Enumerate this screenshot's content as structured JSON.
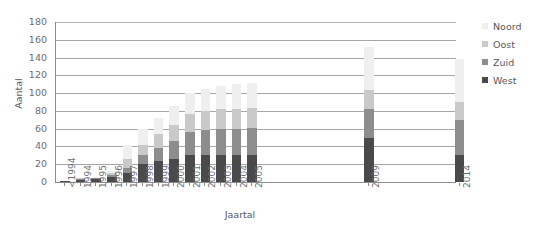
{
  "chart_data": {
    "type": "bar",
    "subtype": "stacked-vertical",
    "title": "",
    "xlabel": "Jaartal",
    "ylabel": "Aantal",
    "ylim": [
      0,
      180
    ],
    "ytick_step": 20,
    "yticks": [
      180,
      160,
      140,
      120,
      100,
      80,
      60,
      40,
      20,
      0
    ],
    "grid": "horizontal",
    "legend_position": "right",
    "categories": [
      "<1994",
      "1994",
      "1995",
      "1996",
      "1997",
      "1998",
      "1999",
      "2000",
      "2001",
      "2002",
      "2003",
      "2004",
      "2005",
      "2009",
      "2014"
    ],
    "series": [
      {
        "name": "West",
        "color": "#4a4a4a",
        "values": [
          1,
          2,
          3,
          6,
          10,
          20,
          24,
          26,
          30,
          30,
          30,
          30,
          30,
          50,
          30
        ]
      },
      {
        "name": "Zuid",
        "color": "#8d8d8d",
        "values": [
          0,
          1,
          1,
          2,
          6,
          10,
          14,
          20,
          26,
          28,
          30,
          30,
          31,
          32,
          40
        ]
      },
      {
        "name": "Oost",
        "color": "#c9c9c9",
        "values": [
          0,
          1,
          1,
          2,
          10,
          12,
          16,
          18,
          20,
          22,
          22,
          22,
          22,
          22,
          20
        ]
      },
      {
        "name": "Noord",
        "color": "#efefef",
        "values": [
          0,
          0,
          1,
          2,
          16,
          18,
          18,
          22,
          24,
          25,
          26,
          28,
          28,
          48,
          48
        ]
      }
    ],
    "totals": [
      1,
      4,
      6,
      12,
      42,
      60,
      72,
      86,
      100,
      105,
      108,
      110,
      111,
      152,
      138
    ],
    "colors": {
      "grid": "#a7a7a7",
      "axis": "#8c8c8c",
      "text": "#58585a",
      "tick_text": "#6d6e71",
      "background": "#ffffff"
    },
    "axis_gap_note": "x-axis has gaps between 2005 and 2009 and between 2009 and 2014"
  },
  "legend": {
    "items": [
      {
        "label": "Noord",
        "color": "#efefef"
      },
      {
        "label": "Oost",
        "color": "#c9c9c9"
      },
      {
        "label": "Zuid",
        "color": "#8d8d8d"
      },
      {
        "label": "West",
        "color": "#4a4a4a"
      }
    ]
  }
}
